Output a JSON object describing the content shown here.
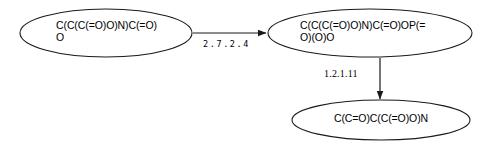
{
  "diagram": {
    "type": "directed-graph",
    "title": "",
    "background_color": "#ffffff",
    "stroke_color": "#1a1a1a",
    "text_color": "#000000",
    "nodes": [
      {
        "id": "node-1",
        "label": "C(C(C(=O)O)N)C(=O)\nO",
        "shape": "ellipse"
      },
      {
        "id": "node-2",
        "label": "C(C(C(=O)O)N)C(=O)OP(=\nO)(O)O",
        "shape": "ellipse"
      },
      {
        "id": "node-3",
        "label": "C(C=O)C(C(=O)O)N",
        "shape": "ellipse"
      }
    ],
    "edges": [
      {
        "id": "edge-1",
        "from": "node-1",
        "to": "node-2",
        "label": "2.7.2.4",
        "direction": "horizontal"
      },
      {
        "id": "edge-2",
        "from": "node-2",
        "to": "node-3",
        "label": "1.2.1.11",
        "direction": "vertical"
      }
    ]
  }
}
